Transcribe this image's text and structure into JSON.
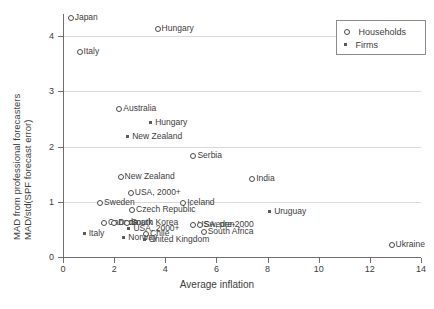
{
  "chart_data": {
    "type": "scatter",
    "title": "",
    "xlabel": "Average inflation",
    "ylabel_line1": "MAD from professional forecasters",
    "ylabel_line2": "MAD/std(SPF forecast error)",
    "xlim": [
      0,
      14
    ],
    "ylim": [
      0,
      4.4
    ],
    "xticks": [
      0,
      2,
      4,
      6,
      8,
      10,
      12,
      14
    ],
    "yticks": [
      0,
      1,
      2,
      3,
      4
    ],
    "grid": "horizontal",
    "legend_position": "top-right",
    "series": [
      {
        "name": "Households",
        "marker": "open-circle",
        "points": [
          {
            "label": "Japan",
            "x": 0.3,
            "y": 4.32,
            "label_side": "right"
          },
          {
            "label": "Hungary",
            "x": 3.7,
            "y": 4.12,
            "label_side": "right"
          },
          {
            "label": "Italy",
            "x": 0.65,
            "y": 3.72,
            "label_side": "right"
          },
          {
            "label": "Australia",
            "x": 2.2,
            "y": 2.68,
            "label_side": "right"
          },
          {
            "label": "Serbia",
            "x": 5.1,
            "y": 1.82,
            "label_side": "right"
          },
          {
            "label": "India",
            "x": 7.4,
            "y": 1.42,
            "label_side": "right"
          },
          {
            "label": "New Zealand",
            "x": 2.25,
            "y": 1.45,
            "label_side": "right"
          },
          {
            "label": "USA, 2000+",
            "x": 2.65,
            "y": 1.15,
            "label_side": "right"
          },
          {
            "label": "Sweden",
            "x": 1.45,
            "y": 0.98,
            "label_side": "right"
          },
          {
            "label": "Iceland",
            "x": 4.7,
            "y": 0.98,
            "label_side": "right"
          },
          {
            "label": "Czech Republic",
            "x": 2.7,
            "y": 0.86,
            "label_side": "right"
          },
          {
            "label": "Canada",
            "x": 1.6,
            "y": 0.62,
            "label_side": "right"
          },
          {
            "label": "Denmark",
            "x": 2.0,
            "y": 0.62,
            "label_side": "right"
          },
          {
            "label": "South Korea",
            "x": 2.5,
            "y": 0.62,
            "label_side": "right"
          },
          {
            "label": "USA, pre-2000",
            "x": 5.1,
            "y": 0.58,
            "label_side": "right"
          },
          {
            "label": "Sweden",
            "x": 5.35,
            "y": 0.58,
            "label_side": "right"
          },
          {
            "label": "South Africa",
            "x": 5.5,
            "y": 0.45,
            "label_side": "right"
          },
          {
            "label": "Chile",
            "x": 3.25,
            "y": 0.42,
            "label_side": "right"
          },
          {
            "label": "Ukraine",
            "x": 12.85,
            "y": 0.22,
            "label_side": "right"
          }
        ]
      },
      {
        "name": "Firms",
        "marker": "filled-square",
        "points": [
          {
            "label": "Hungary",
            "x": 3.45,
            "y": 2.42,
            "label_side": "right"
          },
          {
            "label": "New Zealand",
            "x": 2.55,
            "y": 2.18,
            "label_side": "right"
          },
          {
            "label": "Uruguay",
            "x": 8.1,
            "y": 0.82,
            "label_side": "right"
          },
          {
            "label": "Italy",
            "x": 0.85,
            "y": 0.42,
            "label_side": "right"
          },
          {
            "label": "USA, 2000+",
            "x": 2.6,
            "y": 0.5,
            "label_side": "right"
          },
          {
            "label": "Norway",
            "x": 2.4,
            "y": 0.34,
            "label_side": "right"
          },
          {
            "label": "United Kingdom",
            "x": 3.2,
            "y": 0.3,
            "label_side": "right"
          }
        ]
      }
    ],
    "legend": [
      {
        "name": "Households",
        "marker": "open-circle"
      },
      {
        "name": "Firms",
        "marker": "filled-square"
      }
    ]
  }
}
